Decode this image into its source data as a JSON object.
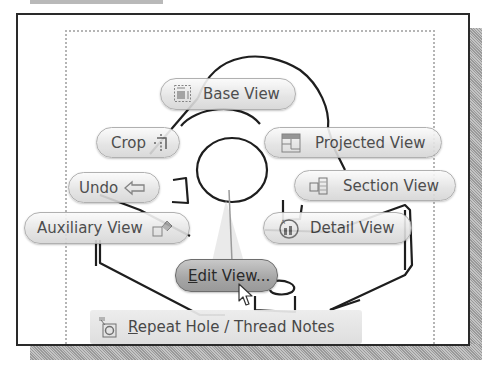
{
  "marking_menu": {
    "items": [
      {
        "id": "base-view",
        "label": "Base View",
        "icon": "base-view-icon"
      },
      {
        "id": "crop",
        "label": "Crop",
        "icon": "crop-icon"
      },
      {
        "id": "projected-view",
        "label": "Projected View",
        "icon": "projected-view-icon"
      },
      {
        "id": "undo",
        "label": "Undo",
        "icon": "undo-arrow-icon"
      },
      {
        "id": "section-view",
        "label": "Section View",
        "icon": "section-view-icon"
      },
      {
        "id": "auxiliary-view",
        "label": "Auxiliary View",
        "icon": "auxiliary-view-icon"
      },
      {
        "id": "detail-view",
        "label": "Detail View",
        "icon": "detail-view-icon"
      },
      {
        "id": "edit-view",
        "label_mnemonic": "E",
        "label_rest": "dit View...",
        "icon": "",
        "selected": true
      }
    ],
    "overflow": {
      "label_mnemonic": "R",
      "label_rest": "epeat Hole / Thread Notes",
      "icon": "repeat-hole-thread-notes-icon"
    }
  },
  "colors": {
    "frame": "#2a2a2a",
    "shadow": "#b0b0b0",
    "pill_bg": "#e6e6e6",
    "pill_selected_bg": "#a8a8a8",
    "text": "#3a3a3a",
    "sheet_border": "#b5b5b5"
  }
}
